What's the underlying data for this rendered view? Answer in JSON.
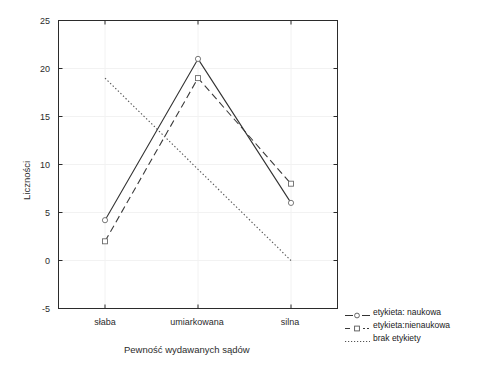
{
  "chart_data": {
    "type": "line",
    "title": "",
    "xlabel": "Pewność wydawanych sądów",
    "ylabel": "Liczności",
    "categories": [
      "słaba",
      "umiarkowana",
      "silna"
    ],
    "ylim": [
      -5,
      25
    ],
    "yticks": [
      25,
      20,
      15,
      10,
      5,
      0,
      -5
    ],
    "ytick_labels": [
      "25",
      "20",
      "15",
      "10",
      "5",
      "0",
      "-5"
    ],
    "grid": true,
    "legend_position": "right",
    "series": [
      {
        "name": "etykieta: naukowa",
        "values": [
          4.2,
          21,
          6
        ],
        "style": "solid",
        "marker": "circle",
        "color": "#333333"
      },
      {
        "name": "etykieta:nienaukowa",
        "values": [
          2,
          19,
          8
        ],
        "style": "dashed",
        "marker": "square",
        "color": "#3a3a3a"
      },
      {
        "name": "brak etykiety",
        "values": [
          19,
          9.5,
          0
        ],
        "style": "dotted",
        "marker": "none",
        "color": "#555555"
      }
    ]
  },
  "axes": {
    "ylabel": "Liczności",
    "xlabel": "Pewność wydawanych sądów",
    "ytick_0": "25",
    "ytick_1": "20",
    "ytick_2": "15",
    "ytick_3": "10",
    "ytick_4": "5",
    "ytick_5": "0",
    "ytick_6": "-5",
    "xtick_0": "słaba",
    "xtick_1": "umiarkowana",
    "xtick_2": "silna"
  },
  "legend": {
    "items": [
      {
        "label": "etykieta: naukowa"
      },
      {
        "label": "etykieta:nienaukowa"
      },
      {
        "label": "brak etykiety"
      }
    ]
  },
  "colors": {
    "frame": "#2b2b2b",
    "grid": "#f2f2f2",
    "series_solid": "#333333",
    "series_dashed": "#3a3a3a",
    "series_dotted": "#555555",
    "background": "#ffffff"
  }
}
